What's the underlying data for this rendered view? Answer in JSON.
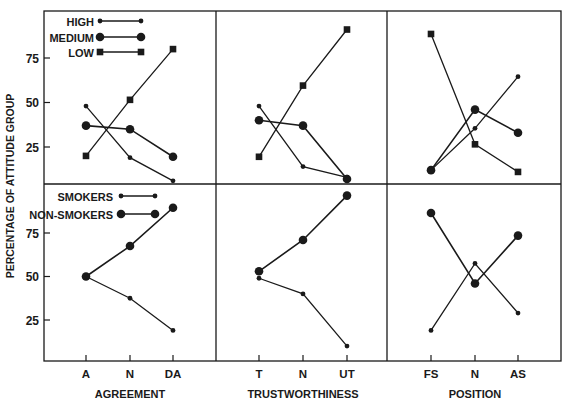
{
  "chart_data": {
    "type": "line",
    "ylabel": "PERCENTAGE OF ATTITUDE GROUP",
    "yticks": [
      25,
      50,
      75
    ],
    "ylim": [
      5,
      100
    ],
    "grid": false,
    "rows": [
      {
        "name": "attitude",
        "legend": [
          {
            "name": "HIGH",
            "marker": "small-dot"
          },
          {
            "name": "MEDIUM",
            "marker": "large-dot"
          },
          {
            "name": "LOW",
            "marker": "square"
          }
        ],
        "panels": [
          {
            "xlabel": "AGREEMENT",
            "categories": [
              "A",
              "N",
              "DA"
            ],
            "series": [
              {
                "name": "HIGH",
                "values": [
                  48,
                  19,
                  6
                ]
              },
              {
                "name": "MEDIUM",
                "values": [
                  37,
                  35,
                  19.5
                ]
              },
              {
                "name": "LOW",
                "values": [
                  20,
                  51.5,
                  80
                ]
              }
            ]
          },
          {
            "xlabel": "TRUSTWORTHINESS",
            "categories": [
              "T",
              "N",
              "UT"
            ],
            "series": [
              {
                "name": "HIGH",
                "values": [
                  48,
                  14,
                  8
                ]
              },
              {
                "name": "MEDIUM",
                "values": [
                  40,
                  37,
                  7
                ]
              },
              {
                "name": "LOW",
                "values": [
                  19.5,
                  59.5,
                  91
                ]
              }
            ]
          },
          {
            "xlabel": "POSITION",
            "categories": [
              "FS",
              "N",
              "AS"
            ],
            "series": [
              {
                "name": "HIGH",
                "values": [
                  12,
                  35.5,
                  64.5
                ]
              },
              {
                "name": "MEDIUM",
                "values": [
                  12,
                  46,
                  33
                ]
              },
              {
                "name": "LOW",
                "values": [
                  88.5,
                  26.5,
                  11
                ]
              }
            ]
          }
        ]
      },
      {
        "name": "smoking",
        "legend": [
          {
            "name": "SMOKERS",
            "marker": "small-dot"
          },
          {
            "name": "NON-SMOKERS",
            "marker": "large-dot"
          }
        ],
        "panels": [
          {
            "xlabel": "AGREEMENT",
            "categories": [
              "A",
              "N",
              "DA"
            ],
            "series": [
              {
                "name": "SMOKERS",
                "values": [
                  50,
                  37.5,
                  19
                ]
              },
              {
                "name": "NON-SMOKERS",
                "values": [
                  50,
                  67.5,
                  89.5
                ]
              }
            ]
          },
          {
            "xlabel": "TRUSTWORTHINESS",
            "categories": [
              "T",
              "N",
              "UT"
            ],
            "series": [
              {
                "name": "SMOKERS",
                "values": [
                  49,
                  40,
                  10
                ]
              },
              {
                "name": "NON-SMOKERS",
                "values": [
                  53,
                  71,
                  96.5
                ]
              }
            ]
          },
          {
            "xlabel": "POSITION",
            "categories": [
              "FS",
              "N",
              "AS"
            ],
            "series": [
              {
                "name": "SMOKERS",
                "values": [
                  19,
                  57.5,
                  29
                ]
              },
              {
                "name": "NON-SMOKERS",
                "values": [
                  86.5,
                  46,
                  73.5
                ]
              }
            ]
          }
        ]
      }
    ]
  }
}
